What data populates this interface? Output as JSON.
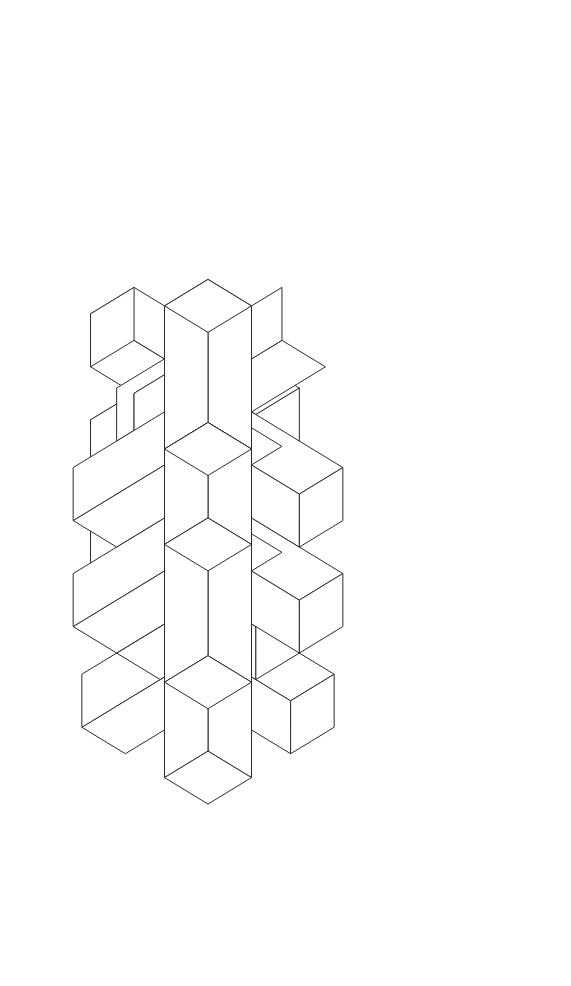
{
  "document": {
    "title": "Isometric Interlocking Beam Lattice",
    "kind": "line-drawing",
    "width": 571,
    "height": 986,
    "background_color": "#ffffff",
    "stroke_color": "#2b2b2b",
    "fill_color": "#ffffff",
    "stroke_width": 1,
    "visible_text": []
  },
  "projection": {
    "type": "isometric",
    "unit_x_px": 43.5,
    "unit_y_px": 26.5,
    "unit_z_px": 53.0,
    "origin_x_px": 208,
    "origin_y_px": 449,
    "notes": "screen_x = origin_x + (a - b) * unit_x ; screen_y = origin_y + (a + b) * unit_y - c * unit_z"
  },
  "scene": {
    "name": "interlocking-beams",
    "beam_count": 22,
    "beam_cross_section_units": 1,
    "beams": [
      {
        "id": "v-top",
        "axis": "z",
        "start": [
          0,
          0,
          2.7
        ],
        "end": [
          0,
          0,
          0.0
        ]
      },
      {
        "id": "v-upper-mid",
        "axis": "z",
        "start": [
          1,
          1,
          1.0
        ],
        "end": [
          1,
          1,
          -1.6
        ]
      },
      {
        "id": "v-center",
        "axis": "z",
        "start": [
          0,
          0,
          0.5
        ],
        "end": [
          0,
          0,
          -3.0
        ]
      },
      {
        "id": "v-right-mid",
        "axis": "z",
        "start": [
          2,
          2,
          0.2
        ],
        "end": [
          2,
          2,
          -2.4
        ]
      },
      {
        "id": "v-lower-left",
        "axis": "z",
        "start": [
          -1,
          -1,
          -1.2
        ],
        "end": [
          -1,
          -1,
          -3.4
        ]
      },
      {
        "id": "v-bottom",
        "axis": "z",
        "start": [
          1,
          1,
          -2.6
        ],
        "end": [
          1,
          1,
          -5.2
        ]
      },
      {
        "id": "h-a-left",
        "axis": "a",
        "start": [
          -2.2,
          0,
          1.2
        ],
        "end": [
          1.6,
          0,
          1.2
        ]
      },
      {
        "id": "h-a-2",
        "axis": "a",
        "start": [
          -1.2,
          0,
          0.2
        ],
        "end": [
          2.6,
          0,
          0.2
        ]
      },
      {
        "id": "h-a-3",
        "axis": "a",
        "start": [
          -2.2,
          0,
          -0.8
        ],
        "end": [
          1.6,
          0,
          -0.8
        ]
      },
      {
        "id": "h-a-4",
        "axis": "a",
        "start": [
          -1.2,
          0,
          -1.8
        ],
        "end": [
          2.6,
          0,
          -1.8
        ]
      },
      {
        "id": "h-a-5",
        "axis": "a",
        "start": [
          -2.2,
          0,
          -2.8
        ],
        "end": [
          1.6,
          0,
          -2.8
        ]
      },
      {
        "id": "h-a-6",
        "axis": "a",
        "start": [
          -1.2,
          0,
          -3.8
        ],
        "end": [
          2.4,
          0,
          -3.8
        ]
      },
      {
        "id": "h-b-1",
        "axis": "b",
        "start": [
          0,
          -2.2,
          1.2
        ],
        "end": [
          0,
          1.6,
          1.2
        ]
      },
      {
        "id": "h-b-2",
        "axis": "b",
        "start": [
          0,
          -1.2,
          0.2
        ],
        "end": [
          0,
          2.6,
          0.2
        ]
      },
      {
        "id": "h-b-3",
        "axis": "b",
        "start": [
          0,
          -2.2,
          -0.8
        ],
        "end": [
          0,
          1.6,
          -0.8
        ]
      },
      {
        "id": "h-b-4",
        "axis": "b",
        "start": [
          0,
          -1.2,
          -1.8
        ],
        "end": [
          0,
          2.6,
          -1.8
        ]
      },
      {
        "id": "h-b-5",
        "axis": "b",
        "start": [
          0,
          -2.2,
          -2.8
        ],
        "end": [
          0,
          1.6,
          -2.8
        ]
      },
      {
        "id": "h-b-6",
        "axis": "b",
        "start": [
          0,
          -1.2,
          -3.8
        ],
        "end": [
          0,
          2.4,
          -3.8
        ]
      }
    ]
  },
  "render_order_note": "Beams are drawn back-to-front; each beam is three quadrilateral faces (top, left, right) filled white with a dark outline, producing the woven occlusion pattern."
}
